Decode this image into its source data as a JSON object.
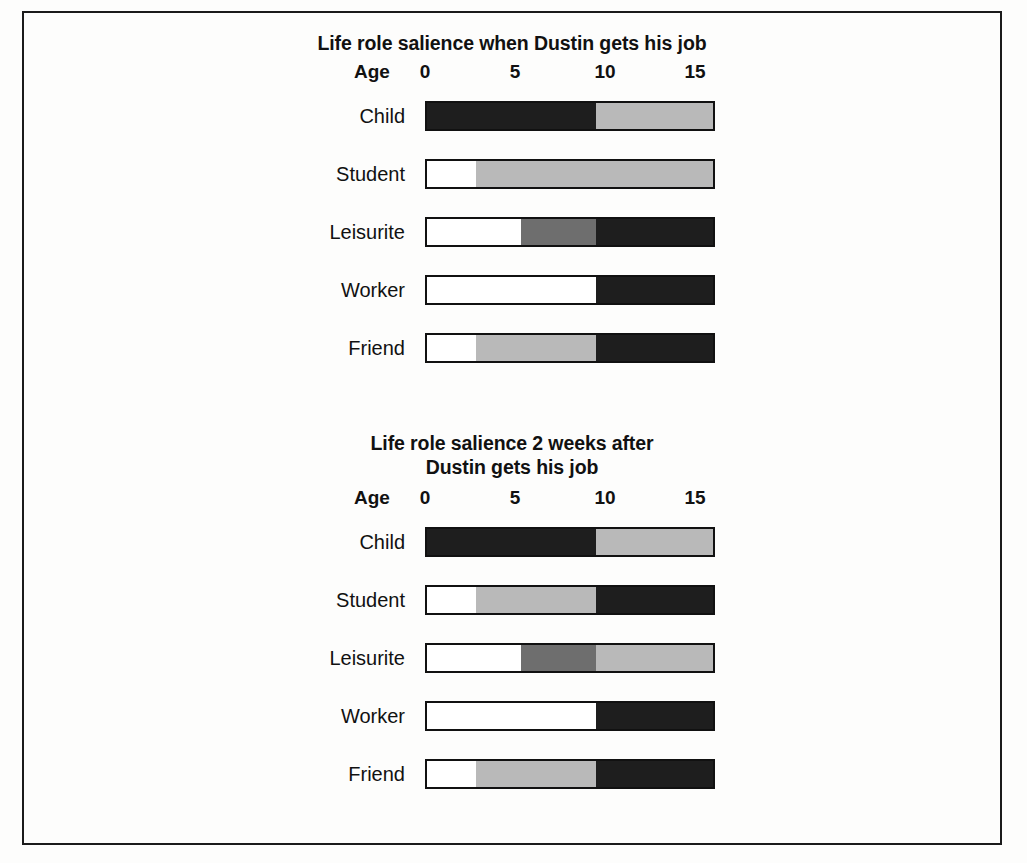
{
  "figure": {
    "axis_label": "Age",
    "tick_values": [
      "0",
      "5",
      "10",
      "15"
    ],
    "row_labels": [
      "Child",
      "Student",
      "Leisurite",
      "Worker",
      "Friend"
    ],
    "palette": {
      "white": "#ffffff",
      "light_gray": "#b9b9b9",
      "medium_gray": "#6e6e6e",
      "dark": "#1e1e1e",
      "outline": "#111111",
      "frame": "#1b1b1b"
    }
  },
  "chart_data": [
    {
      "type": "bar",
      "orientation": "horizontal",
      "stacked": true,
      "title": "Life role salience when Dustin gets his job",
      "title_line1": "Life role salience when Dustin gets his job",
      "title_line2": "",
      "xlabel": "Age",
      "ylabel": "",
      "xlim": [
        0,
        16.1
      ],
      "ticks": [
        0,
        5,
        10,
        15
      ],
      "tick_labels": [
        "0",
        "5",
        "10",
        "15"
      ],
      "grid": false,
      "legend": "none",
      "categories": [
        "Child",
        "Student",
        "Leisurite",
        "Worker",
        "Friend"
      ],
      "rows": [
        {
          "label": "Child",
          "segments": [
            {
              "shade": "dark",
              "start": 0,
              "end": 9.4,
              "span": 9.4
            },
            {
              "shade": "light",
              "start": 9.4,
              "end": 16.1,
              "span": 6.7
            }
          ]
        },
        {
          "label": "Student",
          "segments": [
            {
              "shade": "white",
              "start": 0,
              "end": 2.7,
              "span": 2.7
            },
            {
              "shade": "light",
              "start": 2.7,
              "end": 16.1,
              "span": 13.4
            }
          ]
        },
        {
          "label": "Leisurite",
          "segments": [
            {
              "shade": "white",
              "start": 0,
              "end": 5.2,
              "span": 5.2
            },
            {
              "shade": "medium",
              "start": 5.2,
              "end": 9.4,
              "span": 4.2
            },
            {
              "shade": "dark",
              "start": 9.4,
              "end": 16.1,
              "span": 6.7
            }
          ]
        },
        {
          "label": "Worker",
          "segments": [
            {
              "shade": "white",
              "start": 0,
              "end": 9.4,
              "span": 9.4
            },
            {
              "shade": "dark",
              "start": 9.4,
              "end": 16.1,
              "span": 6.7
            }
          ]
        },
        {
          "label": "Friend",
          "segments": [
            {
              "shade": "white",
              "start": 0,
              "end": 2.7,
              "span": 2.7
            },
            {
              "shade": "light",
              "start": 2.7,
              "end": 9.4,
              "span": 6.7
            },
            {
              "shade": "dark",
              "start": 9.4,
              "end": 16.1,
              "span": 6.7
            }
          ]
        }
      ]
    },
    {
      "type": "bar",
      "orientation": "horizontal",
      "stacked": true,
      "title": "Life role salience 2 weeks after Dustin gets his job",
      "title_line1": "Life role salience 2 weeks after",
      "title_line2": "Dustin gets his job",
      "xlabel": "Age",
      "ylabel": "",
      "xlim": [
        0,
        16.1
      ],
      "ticks": [
        0,
        5,
        10,
        15
      ],
      "tick_labels": [
        "0",
        "5",
        "10",
        "15"
      ],
      "grid": false,
      "legend": "none",
      "categories": [
        "Child",
        "Student",
        "Leisurite",
        "Worker",
        "Friend"
      ],
      "rows": [
        {
          "label": "Child",
          "segments": [
            {
              "shade": "dark",
              "start": 0,
              "end": 9.4,
              "span": 9.4
            },
            {
              "shade": "light",
              "start": 9.4,
              "end": 16.1,
              "span": 6.7
            }
          ]
        },
        {
          "label": "Student",
          "segments": [
            {
              "shade": "white",
              "start": 0,
              "end": 2.7,
              "span": 2.7
            },
            {
              "shade": "light",
              "start": 2.7,
              "end": 9.4,
              "span": 6.7
            },
            {
              "shade": "dark",
              "start": 9.4,
              "end": 16.1,
              "span": 6.7
            }
          ]
        },
        {
          "label": "Leisurite",
          "segments": [
            {
              "shade": "white",
              "start": 0,
              "end": 5.2,
              "span": 5.2
            },
            {
              "shade": "medium",
              "start": 5.2,
              "end": 9.4,
              "span": 4.2
            },
            {
              "shade": "light",
              "start": 9.4,
              "end": 16.1,
              "span": 6.7
            }
          ]
        },
        {
          "label": "Worker",
          "segments": [
            {
              "shade": "white",
              "start": 0,
              "end": 9.4,
              "span": 9.4
            },
            {
              "shade": "dark",
              "start": 9.4,
              "end": 16.1,
              "span": 6.7
            }
          ]
        },
        {
          "label": "Friend",
          "segments": [
            {
              "shade": "white",
              "start": 0,
              "end": 2.7,
              "span": 2.7
            },
            {
              "shade": "light",
              "start": 2.7,
              "end": 9.4,
              "span": 6.7
            },
            {
              "shade": "dark",
              "start": 9.4,
              "end": 16.1,
              "span": 6.7
            }
          ]
        }
      ]
    }
  ]
}
